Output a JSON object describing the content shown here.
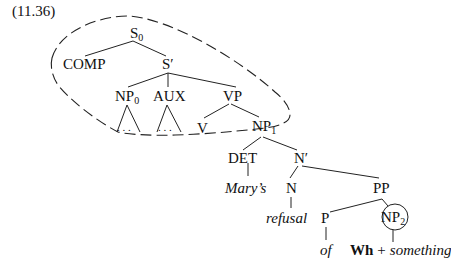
{
  "example_number": "(11.36)",
  "tree": {
    "S0": {
      "base": "S",
      "sub": "0"
    },
    "COMP": "COMP",
    "Sbar": "S′",
    "NP0": {
      "base": "NP",
      "sub": "0"
    },
    "AUX": "AUX",
    "VP": "VP",
    "NP0_tri": ". . .",
    "AUX_tri": ". . .",
    "V": "V",
    "NP1": {
      "base": "NP",
      "sub": "1"
    },
    "DET": "DET",
    "Nbar": "N′",
    "marys": "Mary’s",
    "N": "N",
    "PP": "PP",
    "refusal": "refusal",
    "P": "P",
    "NP2": {
      "base": "NP",
      "sub": "2"
    },
    "of": "of",
    "wh": "Wh",
    "plus": "+",
    "something": "something"
  },
  "annotations": {
    "dashed_region": "encloses S0, COMP, S′, NP0, AUX, VP, V, NP1",
    "circled_node": "NP2"
  }
}
